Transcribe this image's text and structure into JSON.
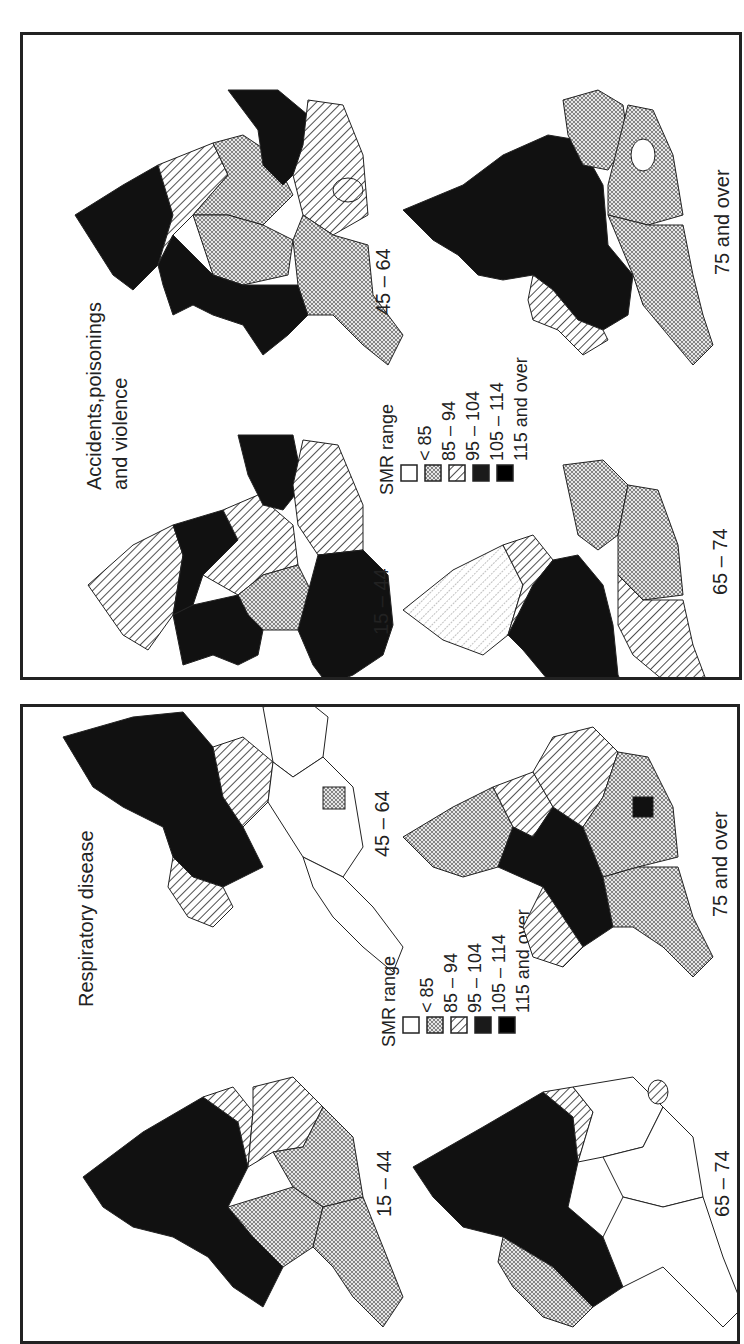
{
  "orientation": "rotated 90° counter-clockwise",
  "legend": {
    "title": "SMR range",
    "classes": [
      {
        "label": "< 85",
        "pattern": "white"
      },
      {
        "label": "85 – 94",
        "pattern": "dots"
      },
      {
        "label": "95 – 104",
        "pattern": "hatch"
      },
      {
        "label": "105 – 114",
        "pattern": "dark"
      },
      {
        "label": "115 and over",
        "pattern": "black"
      }
    ]
  },
  "panels": [
    {
      "title_line1": "Accidents,poisonings",
      "title_line2": "and violence",
      "maps": [
        {
          "age_label": "15 – 44",
          "regions": [
            "hatch",
            "black",
            "hatch",
            "black",
            "dots",
            "hatch",
            "black",
            "hatch",
            "black"
          ]
        },
        {
          "age_label": "45 – 64",
          "regions": [
            "black",
            "hatch",
            "dots",
            "black",
            "dots",
            "black",
            "dots",
            "hatch",
            "dots"
          ]
        },
        {
          "age_label": "65 – 74",
          "regions": [
            "hatch-light",
            "hatch",
            "black",
            "dots",
            "dots",
            "hatch",
            "black",
            "hatch",
            "hatch"
          ]
        },
        {
          "age_label": "75 and over",
          "regions": [
            "black",
            "black",
            "black",
            "dots",
            "dots",
            "hatch",
            "black",
            "dots",
            "dots"
          ]
        }
      ]
    },
    {
      "title_line1": "Respiratory disease",
      "title_line2": "",
      "maps": [
        {
          "age_label": "15 – 44",
          "regions": [
            "black",
            "hatch",
            "black",
            "dots",
            "dots",
            "dots",
            "black",
            "dots",
            "dots"
          ]
        },
        {
          "age_label": "45 – 64",
          "regions": [
            "black",
            "hatch",
            "black",
            "white",
            "white",
            "hatch",
            "black",
            "white",
            "white"
          ]
        },
        {
          "age_label": "65 – 74",
          "regions": [
            "black",
            "hatch",
            "black",
            "white",
            "white",
            "dots",
            "black",
            "white",
            "white"
          ]
        },
        {
          "age_label": "75 and over",
          "regions": [
            "dots",
            "hatch",
            "black",
            "hatch",
            "dots",
            "hatch",
            "black",
            "dots",
            "dots"
          ]
        }
      ]
    }
  ]
}
